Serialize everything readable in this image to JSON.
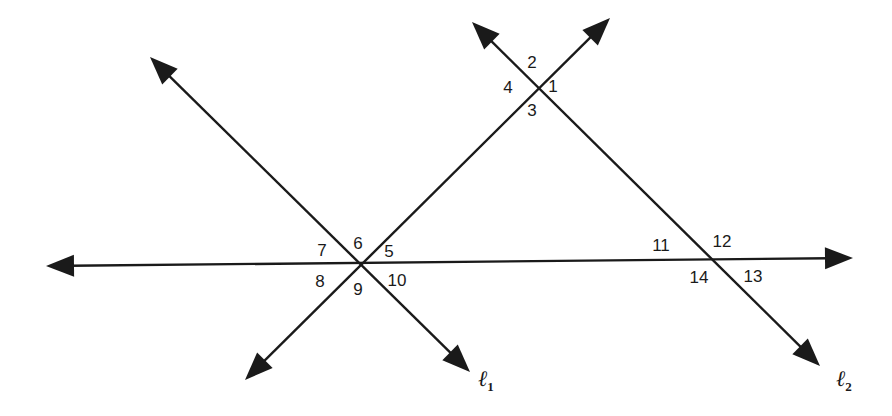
{
  "diagram": {
    "title": "",
    "stroke_color": "#1a1a1a",
    "lines": [
      {
        "id": "horizontal-line",
        "from": [
          46,
          266
        ],
        "to": [
          853,
          258
        ],
        "arrows": [
          "start",
          "end"
        ]
      },
      {
        "id": "transversal",
        "from": [
          245,
          380
        ],
        "to": [
          610,
          18
        ],
        "arrows": [
          "start",
          "end"
        ]
      },
      {
        "id": "line-l1",
        "from": [
          150,
          57
        ],
        "to": [
          470,
          372
        ],
        "arrows": [
          "start",
          "end"
        ],
        "label": "ℓ",
        "subscript": "1"
      },
      {
        "id": "line-l2",
        "from": [
          472,
          22
        ],
        "to": [
          820,
          366
        ],
        "arrows": [
          "start",
          "end"
        ],
        "label": "ℓ",
        "subscript": "2"
      }
    ],
    "intersections": [
      {
        "id": "top",
        "point": [
          533,
          85
        ]
      },
      {
        "id": "left",
        "point": [
          358,
          263
        ]
      },
      {
        "id": "right",
        "point": [
          700,
          262
        ]
      }
    ],
    "angle_labels": [
      {
        "text": "1",
        "x": 553,
        "y": 86
      },
      {
        "text": "2",
        "x": 532,
        "y": 62
      },
      {
        "text": "3",
        "x": 532,
        "y": 110
      },
      {
        "text": "4",
        "x": 508,
        "y": 87
      },
      {
        "text": "5",
        "x": 389,
        "y": 251
      },
      {
        "text": "6",
        "x": 358,
        "y": 243
      },
      {
        "text": "7",
        "x": 322,
        "y": 250
      },
      {
        "text": "8",
        "x": 320,
        "y": 281
      },
      {
        "text": "9",
        "x": 358,
        "y": 289
      },
      {
        "text": "10",
        "x": 397,
        "y": 280
      },
      {
        "text": "11",
        "x": 661,
        "y": 245
      },
      {
        "text": "12",
        "x": 722,
        "y": 241
      },
      {
        "text": "13",
        "x": 753,
        "y": 276
      },
      {
        "text": "14",
        "x": 699,
        "y": 277
      }
    ],
    "line_labels": [
      {
        "text": "ℓ",
        "subscript": "1",
        "x": 478,
        "y": 368
      },
      {
        "text": "ℓ",
        "subscript": "2",
        "x": 836,
        "y": 368
      }
    ]
  }
}
